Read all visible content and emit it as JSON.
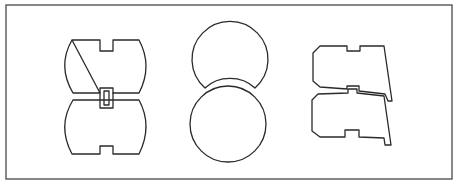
{
  "figure": {
    "width": 457,
    "height": 181,
    "background": "#ffffff",
    "line_color": "#2a2a2a",
    "frame_color": "#555555"
  },
  "frame": {
    "x": 6,
    "y": 5,
    "width": 446,
    "height": 174
  },
  "groups": [
    {
      "id": "notched-barrel-pair",
      "description": "Two barrel-shaped plates with rectangular notches, joined by a central rectangular tab",
      "parts": [
        "upper-barrel-plate",
        "lower-barrel-plate",
        "center-tab"
      ]
    },
    {
      "id": "circle-pair",
      "description": "Two circular discs, upper disc with concave cut nesting against lower disc",
      "parts": [
        "upper-circle-disc",
        "lower-circle-disc"
      ]
    },
    {
      "id": "stepped-plate-pair",
      "description": "Two trapezoidal stepped plates with notches, stacked and interlocking",
      "parts": [
        "upper-stepped-plate",
        "lower-stepped-plate"
      ]
    }
  ]
}
